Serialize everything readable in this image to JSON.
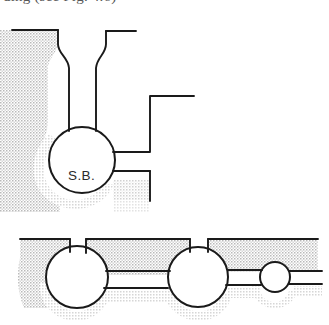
{
  "figure": {
    "caption_clipped": "ding (see Fig. 4.6)",
    "background_color": "#ffffff",
    "ink_color": "#1a1a1a",
    "stipple_dot_color": "#b9b9b9",
    "labels": [
      {
        "id": "settling-basin",
        "text": "S.B.",
        "x": 85,
        "y": 168
      }
    ],
    "upper_plan": {
      "name": "upper-plan-view",
      "chamber": {
        "name": "settling-basin-chamber",
        "cx": 82,
        "cy": 160,
        "r": 33
      },
      "notes": "vertical bottle-neck channel feeding a round chamber, with two stepped outlet channels to the right"
    },
    "lower_plan": {
      "name": "lower-plan-view",
      "chambers": [
        {
          "name": "lower-chamber-left",
          "cx": 77,
          "cy": 277,
          "r": 31
        },
        {
          "name": "lower-chamber-middle",
          "cx": 198,
          "cy": 277,
          "r": 30
        },
        {
          "name": "lower-chamber-right",
          "cx": 275,
          "cy": 277,
          "r": 15
        }
      ],
      "notes": "horizontal channel run connecting three round chambers of decreasing size"
    }
  }
}
